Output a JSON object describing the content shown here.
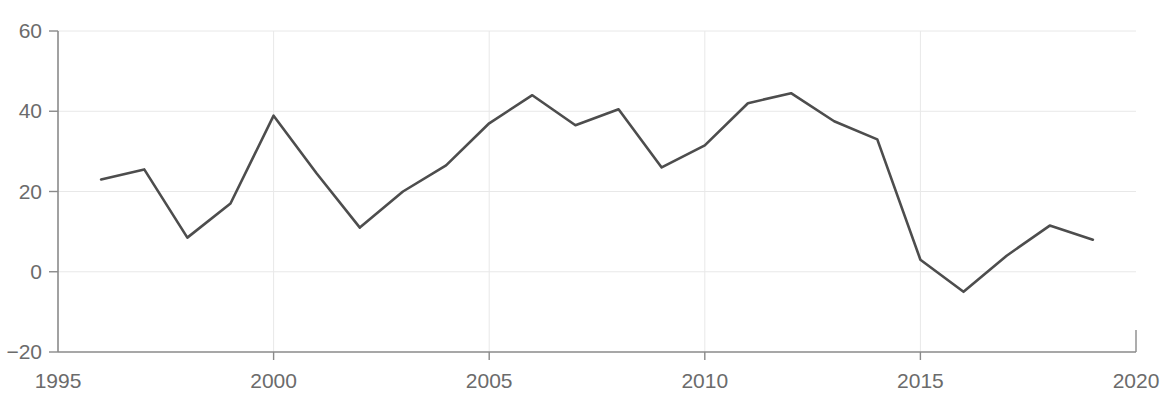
{
  "chart_data": {
    "type": "line",
    "title": "",
    "subtitle": "",
    "xlabel": "",
    "ylabel": "",
    "xlim": [
      1995,
      2020
    ],
    "ylim": [
      -20,
      60
    ],
    "grid": true,
    "legend": false,
    "legend_position": "none",
    "line_color": "#4d4d4d",
    "grid_color": "#e8e8e8",
    "axis_color": "#8a8a8a",
    "tick_label_color": "#6b6b6b",
    "x_ticks": [
      1995,
      2000,
      2005,
      2010,
      2015,
      2020
    ],
    "x_tick_labels": [
      "1995",
      "2000",
      "2005",
      "2010",
      "2015",
      "2020"
    ],
    "y_ticks": [
      -20,
      0,
      20,
      40,
      60
    ],
    "y_tick_labels": [
      "−20",
      "0",
      "20",
      "40",
      "60"
    ],
    "x": [
      1996,
      1997,
      1998,
      1999,
      2000,
      2001,
      2002,
      2003,
      2004,
      2005,
      2006,
      2007,
      2008,
      2009,
      2010,
      2011,
      2012,
      2013,
      2014,
      2015,
      2016,
      2017,
      2018,
      2019
    ],
    "values": [
      23,
      25.5,
      8.5,
      17,
      38.9,
      24.5,
      11,
      20,
      26.5,
      37,
      44,
      36.5,
      40.5,
      26,
      31.5,
      42,
      44.5,
      37.5,
      33,
      3,
      -5,
      4,
      11.5,
      8
    ],
    "series": [
      {
        "name": "series-1",
        "values": [
          23,
          25.5,
          8.5,
          17,
          38.9,
          24.5,
          11,
          20,
          26.5,
          37,
          44,
          36.5,
          40.5,
          26,
          31.5,
          42,
          44.5,
          37.5,
          33,
          3,
          -5,
          4,
          11.5,
          8
        ]
      }
    ]
  }
}
